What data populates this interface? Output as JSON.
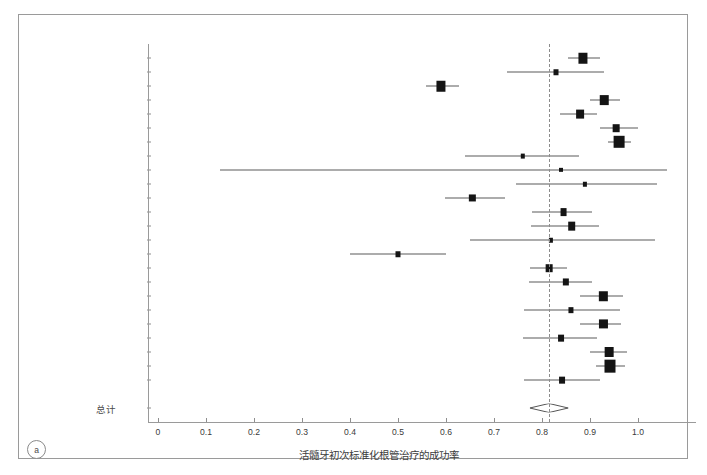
{
  "figure": {
    "panel_tag": "a",
    "total_label": "总计",
    "xlabel": "活髓牙初次标准化根管治疗的成功率"
  },
  "chart_data": {
    "type": "scatter",
    "subtype": "forest-plot",
    "title": "",
    "xlabel": "活髓牙初次标准化根管治疗的成功率",
    "ylabel": "",
    "xlim": [
      -0.04,
      1.12
    ],
    "xticks": [
      0,
      0.1,
      0.2,
      0.3,
      0.4,
      0.5,
      0.6,
      0.7,
      0.8,
      0.9,
      1.0
    ],
    "xticklabels": [
      "0",
      "0.1",
      "0.2",
      "0.3",
      "0.4",
      "0.5",
      "0.6",
      "0.7",
      "0.8",
      "0.9",
      "1.0"
    ],
    "grid": false,
    "legend": "none",
    "reference_line": 0.815,
    "summary": {
      "label": "总计",
      "estimate": 0.815,
      "ci_low": 0.775,
      "ci_high": 0.855,
      "marker": "diamond"
    },
    "categories": [
      "Adenubi & Rule (1976)",
      "Heling & Shapira (1978)",
      "Jokinen et al. (1978)",
      "Halse & Molven (1987)",
      "Safavi et al. (1987)",
      "Akerblom & Hasselgren (1988)",
      "Sjogren et al. (1990)",
      "Peak (1994)",
      "Peretz et al. (1997)",
      "Lilly et al. (1998)",
      "Cheung (2002)",
      "Hoskinson et al. (2002)",
      "Chugal et al. (2003)",
      "Chu et al. (2005)",
      "Moshonov et al. (2005)",
      "Aqrabawi (2006)",
      "Doyle et al. (2006)",
      "Gesi et al. (2006)",
      "Conner et al. (2007)",
      "Chevigny et al. (2008)",
      "Liang et al. (2011)",
      "Ng et al. (2011)",
      "Ricucci et al. (2011)",
      "Liang et al. (2012)"
    ],
    "studies": [
      {
        "label": "Adenubi & Rule (1976)",
        "estimate": 0.885,
        "ci_low": 0.854,
        "ci_high": 0.921,
        "weight": 0.62
      },
      {
        "label": "Heling & Shapira (1978)",
        "estimate": 0.83,
        "ci_low": 0.728,
        "ci_high": 0.93,
        "weight": 0.1
      },
      {
        "label": "Jokinen et al. (1978)",
        "estimate": 0.59,
        "ci_low": 0.558,
        "ci_high": 0.628,
        "weight": 0.62
      },
      {
        "label": "Halse & Molven (1987)",
        "estimate": 0.93,
        "ci_low": 0.9,
        "ci_high": 0.962,
        "weight": 0.52
      },
      {
        "label": "Safavi et al. (1987)",
        "estimate": 0.88,
        "ci_low": 0.838,
        "ci_high": 0.914,
        "weight": 0.4
      },
      {
        "label": "Akerblom & Hasselgren (1988)",
        "estimate": 0.955,
        "ci_low": 0.92,
        "ci_high": 1.0,
        "weight": 0.26
      },
      {
        "label": "Sjogren et al. (1990)",
        "estimate": 0.96,
        "ci_low": 0.938,
        "ci_high": 0.985,
        "weight": 0.95
      },
      {
        "label": "Peak (1994)",
        "estimate": 0.76,
        "ci_low": 0.64,
        "ci_high": 0.878,
        "weight": 0.06
      },
      {
        "label": "Peretz et al. (1997)",
        "estimate": 0.84,
        "ci_low": 0.13,
        "ci_high": 1.06,
        "weight": 0.04
      },
      {
        "label": "Lilly et al. (1998)",
        "estimate": 0.89,
        "ci_low": 0.745,
        "ci_high": 1.04,
        "weight": 0.05
      },
      {
        "label": "Cheung (2002)",
        "estimate": 0.655,
        "ci_low": 0.598,
        "ci_high": 0.722,
        "weight": 0.22
      },
      {
        "label": "Hoskinson et al. (2002)",
        "estimate": 0.845,
        "ci_low": 0.78,
        "ci_high": 0.905,
        "weight": 0.28
      },
      {
        "label": "Chugal et al. (2003)",
        "estimate": 0.862,
        "ci_low": 0.778,
        "ci_high": 0.918,
        "weight": 0.38
      },
      {
        "label": "Chu et al. (2005)",
        "estimate": 0.818,
        "ci_low": 0.65,
        "ci_high": 1.035,
        "weight": 0.05
      },
      {
        "label": "Moshonov et al. (2005)",
        "estimate": 0.5,
        "ci_low": 0.4,
        "ci_high": 0.6,
        "weight": 0.1
      },
      {
        "label": "Aqrabawi (2006)",
        "estimate": 0.815,
        "ci_low": 0.775,
        "ci_high": 0.852,
        "weight": 0.26
      },
      {
        "label": "Doyle et al. (2006)",
        "estimate": 0.85,
        "ci_low": 0.772,
        "ci_high": 0.905,
        "weight": 0.22
      },
      {
        "label": "Gesi et al. (2006)",
        "estimate": 0.928,
        "ci_low": 0.88,
        "ci_high": 0.968,
        "weight": 0.48
      },
      {
        "label": "Conner et al. (2007)",
        "estimate": 0.86,
        "ci_low": 0.762,
        "ci_high": 0.962,
        "weight": 0.11
      },
      {
        "label": "Chevigny et al. (2008)",
        "estimate": 0.928,
        "ci_low": 0.88,
        "ci_high": 0.965,
        "weight": 0.45
      },
      {
        "label": "Liang et al. (2011)",
        "estimate": 0.84,
        "ci_low": 0.76,
        "ci_high": 0.915,
        "weight": 0.18
      },
      {
        "label": "Ng et al. (2011)",
        "estimate": 0.94,
        "ci_low": 0.9,
        "ci_high": 0.978,
        "weight": 0.55
      },
      {
        "label": "Ricucci et al. (2011)",
        "estimate": 0.942,
        "ci_low": 0.912,
        "ci_high": 0.972,
        "weight": 1.0
      },
      {
        "label": "Liang et al. (2012)",
        "estimate": 0.842,
        "ci_low": 0.762,
        "ci_high": 0.92,
        "weight": 0.18
      }
    ]
  }
}
